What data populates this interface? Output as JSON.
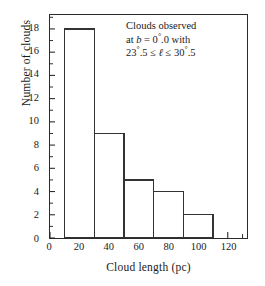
{
  "chart_data": {
    "type": "bar",
    "title": "",
    "xlabel": "Cloud length (pc)",
    "ylabel": "Number of clouds",
    "xlim": [
      0,
      133
    ],
    "ylim": [
      0,
      19.2
    ],
    "grid": false,
    "legend": null,
    "bin_width": 20,
    "bin_edges": [
      10,
      30,
      50,
      70,
      90,
      110
    ],
    "categories": [
      "10–30",
      "30–50",
      "50–70",
      "70–90",
      "90–110"
    ],
    "values": [
      18,
      9,
      5,
      4,
      2
    ],
    "bars": [
      {
        "x0": 10,
        "x1": 30,
        "height": 18
      },
      {
        "x0": 30,
        "x1": 50,
        "height": 9
      },
      {
        "x0": 50,
        "x1": 70,
        "height": 5
      },
      {
        "x0": 70,
        "x1": 90,
        "height": 4
      },
      {
        "x0": 90,
        "x1": 110,
        "height": 2
      }
    ],
    "x_major_ticks": [
      0,
      20,
      40,
      60,
      80,
      100,
      120
    ],
    "x_minor_ticks": [
      10,
      30,
      50,
      70,
      90,
      110,
      130
    ],
    "x_tick_labels": [
      "0",
      "20",
      "40",
      "60",
      "80",
      "100",
      "120"
    ],
    "y_major_ticks": [
      0,
      2,
      4,
      6,
      8,
      10,
      12,
      14,
      16,
      18
    ],
    "y_minor_ticks": [
      1,
      3,
      5,
      7,
      9,
      11,
      13,
      15,
      17,
      19
    ],
    "y_tick_labels": [
      "0",
      "2",
      "4",
      "6",
      "8",
      "10",
      "12",
      "14",
      "16",
      "18"
    ],
    "annotation": {
      "line1": "Clouds observed",
      "line2_prefix": "at ",
      "line2_var": "b",
      "line2_mid": " = 0",
      "line2_deg": "°",
      "line2_suffix": ".0 with",
      "line3_a": "23",
      "line3_deg1": "°",
      "line3_b": ".5 ≤ ",
      "line3_var": "ℓ",
      "line3_c": " ≤ 30",
      "line3_deg2": "°",
      "line3_d": ".5"
    },
    "colors": {
      "bar_fill": "#ffffff",
      "bar_edge": "#333333",
      "axis": "#2b2b2b",
      "text": "#1a1a1a",
      "background": "#ffffff"
    }
  }
}
